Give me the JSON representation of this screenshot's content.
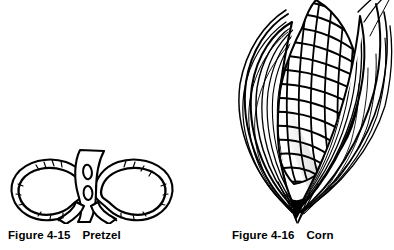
{
  "page": {
    "background_color": "#ffffff",
    "ink_color": "#000000",
    "width": 394,
    "height": 250,
    "kind": "textbook-figure-plate"
  },
  "figures": [
    {
      "id": "pretzel",
      "number": "Figure 4-15",
      "title": "Pretzel",
      "illustration_name": "pretzel-line-drawing",
      "description": "Pen-and-ink line drawing of a twisted pretzel with two loops and crossed ends at the bottom, stippled salt texture on the dough"
    },
    {
      "id": "corn",
      "number": "Figure 4-16",
      "title": "Corn",
      "illustration_name": "corn-line-drawing",
      "description": "Pen-and-ink line drawing of an ear of corn with husk leaves peeled back, kernels shown as a diagonal lattice grid"
    }
  ]
}
